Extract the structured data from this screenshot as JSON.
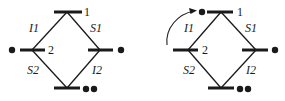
{
  "diagrams": [
    {
      "id": "left",
      "vertex_labels": {
        "top": "1",
        "left": "2"
      },
      "edge_labels": {
        "top_left": "I1",
        "top_right": "S1",
        "bottom_left": "S2",
        "bottom_right": "I2"
      },
      "markers": {
        "left": "•",
        "right": "•",
        "bottom": "••"
      }
    },
    {
      "id": "right",
      "vertex_labels": {
        "top": "1",
        "left": "2"
      },
      "edge_labels": {
        "top_left": "I1",
        "top_right": "S1",
        "bottom_left": "S2",
        "bottom_right": "I2"
      },
      "markers": {
        "top": "•",
        "right": "•",
        "bottom": "••"
      },
      "arrow": "curved arrow from left level to top level"
    }
  ],
  "colors": {
    "ink": "#1a1a1a",
    "background": "#ffffff"
  }
}
